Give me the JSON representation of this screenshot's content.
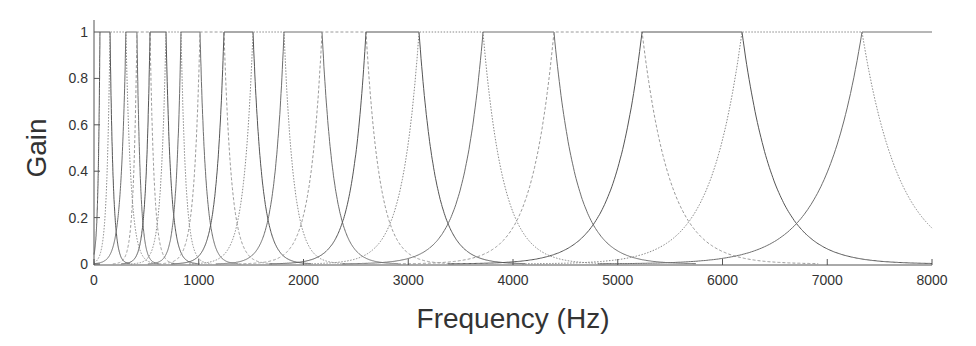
{
  "chart_data": {
    "type": "line",
    "title": "",
    "xlabel": "Frequency (Hz)",
    "ylabel": "Gain",
    "xlim": [
      0,
      8000
    ],
    "ylim": [
      0,
      1
    ],
    "x_ticks": [
      0,
      1000,
      2000,
      3000,
      4000,
      5000,
      6000,
      7000,
      8000
    ],
    "x_tick_labels": [
      "0",
      "1000",
      "2000",
      "3000",
      "4000",
      "5000",
      "6000",
      "7000",
      "8000"
    ],
    "y_ticks": [
      0,
      0.2,
      0.4,
      0.6,
      0.8,
      1
    ],
    "y_tick_labels": [
      "0",
      "0.2",
      "0.4",
      "0.6",
      "0.8",
      "1"
    ],
    "grid": false,
    "legend": null,
    "series": [
      {
        "name": "filter-1",
        "center_hz": 57,
        "peak_gain": 1
      },
      {
        "name": "filter-2",
        "center_hz": 153,
        "peak_gain": 1
      },
      {
        "name": "filter-3",
        "center_hz": 305,
        "peak_gain": 1
      },
      {
        "name": "filter-4",
        "center_hz": 410,
        "peak_gain": 1
      },
      {
        "name": "filter-5",
        "center_hz": 535,
        "peak_gain": 1
      },
      {
        "name": "filter-6",
        "center_hz": 687,
        "peak_gain": 1
      },
      {
        "name": "filter-7",
        "center_hz": 831,
        "peak_gain": 1
      },
      {
        "name": "filter-8",
        "center_hz": 1012,
        "peak_gain": 1
      },
      {
        "name": "filter-9",
        "center_hz": 1241,
        "peak_gain": 1
      },
      {
        "name": "filter-10",
        "center_hz": 1518,
        "peak_gain": 1
      },
      {
        "name": "filter-11",
        "center_hz": 1814,
        "peak_gain": 1
      },
      {
        "name": "filter-12",
        "center_hz": 2177,
        "peak_gain": 1
      },
      {
        "name": "filter-13",
        "center_hz": 2597,
        "peak_gain": 1
      },
      {
        "name": "filter-14",
        "center_hz": 3103,
        "peak_gain": 1
      },
      {
        "name": "filter-15",
        "center_hz": 3714,
        "peak_gain": 1
      },
      {
        "name": "filter-16",
        "center_hz": 4391,
        "peak_gain": 1
      },
      {
        "name": "filter-17",
        "center_hz": 5232,
        "peak_gain": 1
      },
      {
        "name": "filter-18",
        "center_hz": 6186,
        "peak_gain": 1
      },
      {
        "name": "filter-19",
        "center_hz": 7332,
        "peak_gain": 1
      }
    ]
  },
  "colors": {
    "axis": "#555555",
    "curves": [
      "#555555",
      "#888888",
      "#6e6e6e",
      "#9a9a9a"
    ],
    "text": "#333333"
  }
}
